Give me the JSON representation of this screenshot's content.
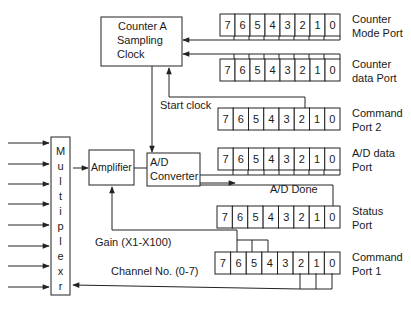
{
  "blocks": {
    "counter_a": {
      "lines": [
        "Counter A",
        "Sampling",
        "Clock"
      ],
      "x": 101,
      "y": 17,
      "w": 81,
      "h": 49
    },
    "multiplexer": {
      "letters": [
        "M",
        "u",
        "l",
        "t",
        "i",
        "p",
        "l",
        "e",
        "x",
        "r"
      ],
      "x": 51,
      "y": 137,
      "w": 19,
      "h": 158
    },
    "amplifier": {
      "label": "Amplifier",
      "x": 89,
      "y": 150,
      "w": 45,
      "h": 35
    },
    "ad_converter": {
      "lines": [
        "A/D",
        "Converter"
      ],
      "x": 147,
      "y": 153,
      "w": 53,
      "h": 33
    }
  },
  "registers": [
    {
      "id": "counter-mode-port",
      "label": [
        "Counter",
        "Mode Port"
      ],
      "x": 220,
      "y": 14,
      "bits": [
        "7",
        "6",
        "5",
        "4",
        "3",
        "2",
        "1",
        "0"
      ]
    },
    {
      "id": "counter-data-port",
      "label": [
        "Counter",
        "data Port"
      ],
      "x": 220,
      "y": 59,
      "bits": [
        "7",
        "6",
        "5",
        "4",
        "3",
        "2",
        "1",
        "0"
      ]
    },
    {
      "id": "command-port-2",
      "label": [
        "Command",
        "Port 2"
      ],
      "x": 218,
      "y": 108,
      "bits": [
        "7",
        "6",
        "5",
        "4",
        "3",
        "2",
        "1",
        "0"
      ]
    },
    {
      "id": "ad-data-port",
      "label": [
        "A/D data",
        "Port"
      ],
      "x": 218,
      "y": 148,
      "bits": [
        "7",
        "6",
        "5",
        "4",
        "3",
        "2",
        "1",
        "0"
      ]
    },
    {
      "id": "status-port",
      "label": [
        "Status",
        "Port"
      ],
      "x": 217,
      "y": 206,
      "bits": [
        "7",
        "6",
        "5",
        "4",
        "3",
        "2",
        "1",
        "0"
      ]
    },
    {
      "id": "command-port-1",
      "label": [
        "Command",
        "Port 1"
      ],
      "x": 215,
      "y": 252,
      "bits": [
        "7",
        "6",
        "5",
        "4",
        "3",
        "2",
        "1",
        "0"
      ]
    }
  ],
  "signals": {
    "start_clock": "Start clock",
    "ad_done": "A/D Done",
    "gain": "Gain (X1-X100)",
    "channel": "Channel No. (0-7)"
  },
  "inputs": {
    "count": 8,
    "y": [
      143,
      164,
      184,
      204,
      225,
      246,
      266,
      287
    ]
  }
}
